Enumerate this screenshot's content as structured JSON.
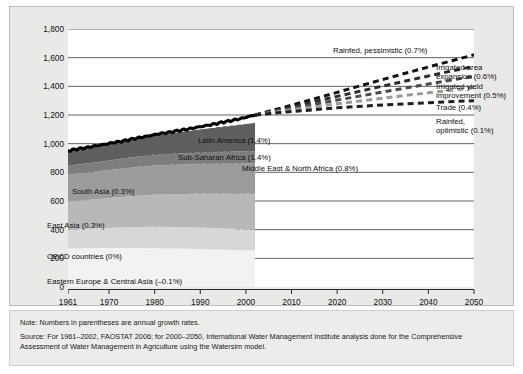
{
  "chart_data": {
    "type": "area",
    "title": "",
    "xlabel": "",
    "ylabel": "Cultivated area in million hectares",
    "xlim": [
      1961,
      2050
    ],
    "ylim": [
      0,
      1800
    ],
    "grid": true,
    "legend": "in-plot annotations",
    "x_ticks": [
      "1961",
      "1970",
      "1980",
      "1990",
      "2000",
      "2010",
      "2020",
      "2030",
      "2040",
      "2050"
    ],
    "x_tick_values": [
      1961,
      1970,
      1980,
      1990,
      2000,
      2010,
      2020,
      2030,
      2040,
      2050
    ],
    "y_ticks": [
      "0",
      "200",
      "400",
      "600",
      "800",
      "1,000",
      "1,200",
      "1,400",
      "1,600",
      "1,800"
    ],
    "y_tick_values": [
      0,
      200,
      400,
      600,
      800,
      1000,
      1200,
      1400,
      1600,
      1800
    ],
    "historical_x": [
      1961,
      1965,
      1970,
      1975,
      1980,
      1985,
      1990,
      1995,
      2000,
      2002
    ],
    "stacked_series": [
      {
        "name": "Eastern Europe & Central Asia",
        "label": "Eastern Europe & Central Asia (–0.1%)",
        "growth_rate": "-0.1%",
        "color": "#f2f2f2",
        "values": [
          268,
          270,
          272,
          272,
          270,
          268,
          265,
          260,
          256,
          255
        ]
      },
      {
        "name": "OECD countries",
        "label": "OECD countries (0%)",
        "growth_rate": "0%",
        "color": "#d7d7d7",
        "values": [
          132,
          136,
          140,
          146,
          150,
          150,
          150,
          148,
          146,
          145
        ]
      },
      {
        "name": "East Asia",
        "label": "East Asia (0.3%)",
        "growth_rate": "0.3%",
        "color": "#b8b8b8",
        "values": [
          196,
          200,
          208,
          216,
          224,
          230,
          236,
          242,
          248,
          250
        ]
      },
      {
        "name": "South Asia",
        "label": "South Asia (0.3%)",
        "growth_rate": "0.3%",
        "color": "#9b9b9b",
        "values": [
          188,
          192,
          196,
          200,
          204,
          206,
          208,
          210,
          212,
          213
        ]
      },
      {
        "name": "Middle East & North Africa",
        "label": "Middle East & North Africa (0.8%)",
        "growth_rate": "0.8%",
        "color": "#7d7d7d",
        "values": [
          62,
          64,
          67,
          70,
          73,
          76,
          79,
          82,
          85,
          86
        ]
      },
      {
        "name": "Sub-Saharan Africa",
        "label": "Sub-Saharan Africa (1.4%)",
        "growth_rate": "1.4%",
        "color": "#5f5f5f",
        "values": [
          104,
          110,
          118,
          128,
          139,
          150,
          162,
          176,
          190,
          196
        ]
      },
      {
        "name": "Latin America",
        "label": "Latin America (1.4%)",
        "growth_rate": "1.4%",
        "color": "#ffffff",
        "values": [
          0,
          0,
          0,
          0,
          0,
          0,
          0,
          0,
          0,
          0
        ]
      }
    ],
    "total_line": {
      "name": "Total cultivated area",
      "color": "#000000",
      "x": [
        1961,
        1963,
        1965,
        1967,
        1969,
        1971,
        1973,
        1975,
        1977,
        1979,
        1981,
        1983,
        1985,
        1987,
        1989,
        1991,
        1993,
        1995,
        1997,
        1999,
        2001,
        2002
      ],
      "values": [
        950,
        963,
        972,
        985,
        995,
        1008,
        1018,
        1032,
        1044,
        1056,
        1070,
        1078,
        1090,
        1100,
        1112,
        1124,
        1136,
        1150,
        1162,
        1176,
        1192,
        1200
      ]
    },
    "projection_x": [
      2002,
      2010,
      2020,
      2030,
      2040,
      2050
    ],
    "projections": [
      {
        "name": "Rainfed, pessimistic",
        "label": "Rainfed, pessimistic (0.7%)",
        "growth_rate": "0.7%",
        "color": "#111111",
        "values": [
          1200,
          1268,
          1358,
          1448,
          1535,
          1620
        ]
      },
      {
        "name": "Irrigated area expansion",
        "label": "Irrigated area expansion (0.6%)",
        "growth_rate": "0.6%",
        "color": "#2b2b2b",
        "values": [
          1200,
          1256,
          1330,
          1402,
          1472,
          1540
        ]
      },
      {
        "name": "Irrigated yield improvement",
        "label": "Irrigated yield improvement (0.5%)",
        "growth_rate": "0.5%",
        "color": "#4a4a4a",
        "values": [
          1200,
          1246,
          1304,
          1360,
          1416,
          1470
        ]
      },
      {
        "name": "Trade",
        "label": "Trade (0.4%)",
        "growth_rate": "0.4%",
        "color": "#9a9a9a",
        "values": [
          1200,
          1236,
          1278,
          1318,
          1355,
          1390
        ]
      },
      {
        "name": "Rainfed, optimistic",
        "label": "Rainfed, optimistic (0.1%)",
        "growth_rate": "0.1%",
        "color": "#1f1f1f",
        "values": [
          1200,
          1224,
          1250,
          1270,
          1286,
          1300
        ]
      }
    ]
  },
  "labels": {
    "latin_america": "Latin America (1.4%)",
    "sub_saharan_africa": "Sub-Saharan Africa (1.4%)",
    "middle_east_north_africa": "Middle East & North Africa (0.8%)",
    "south_asia": "South Asia (0.3%)",
    "east_asia": "East Asia (0.3%)",
    "oecd": "OECD countries (0%)",
    "eeca": "Eastern Europe & Central Asia (–0.1%)",
    "rainfed_pessimistic": "Rainfed, pessimistic (0.7%)",
    "irrigated_area_expansion_l1": "Irrigated area",
    "irrigated_area_expansion_l2": "expansion (0.6%)",
    "irrigated_yield_l1": "Irrigated yield",
    "irrigated_yield_l2": "improvement (0.5%)",
    "trade": "Trade (0.4%)",
    "rainfed_optimistic_l1": "Rainfed,",
    "rainfed_optimistic_l2": "optimistic (0.1%)"
  },
  "axis": {
    "y_title": "Cultivated area in million hectares"
  },
  "notes": {
    "note": "Note: Numbers in parentheses are annual growth rates.",
    "source": "Source: For 1961–2002, FAOSTAT 2006; for 2000–2050, International Water Management Institute analysis done for the Comprehensive Assessment of Water Management in Agriculture using the Watersim model."
  }
}
